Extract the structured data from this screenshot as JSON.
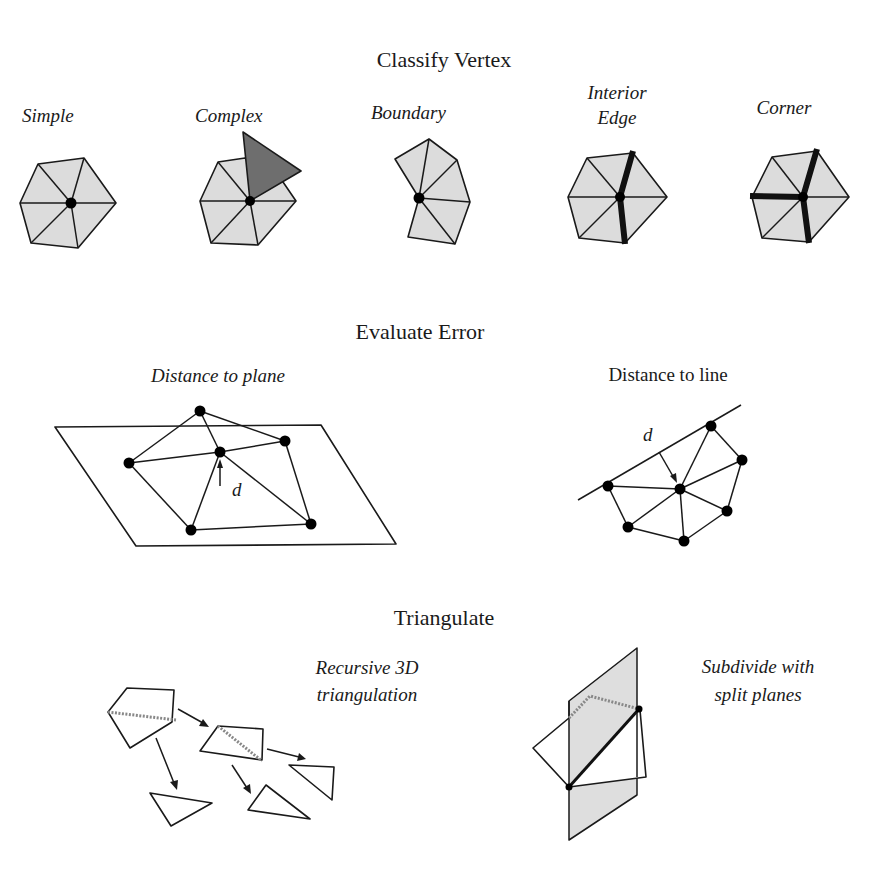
{
  "sections": {
    "classify": {
      "title": "Classify Vertex",
      "cases": [
        {
          "label": "Simple"
        },
        {
          "label": "Complex"
        },
        {
          "label": "Boundary"
        },
        {
          "label_line1": "Interior",
          "label_line2": "Edge"
        },
        {
          "label": "Corner"
        }
      ]
    },
    "evaluate": {
      "title": "Evaluate Error",
      "plane": {
        "label": "Distance to plane",
        "symbol": "d"
      },
      "line": {
        "label": "Distance to line",
        "symbol": "d"
      }
    },
    "triangulate": {
      "title": "Triangulate",
      "recursive": {
        "label_line1": "Recursive 3D",
        "label_line2": "triangulation"
      },
      "split": {
        "label_line1": "Subdivide with",
        "label_line2": "split planes"
      }
    }
  },
  "colors": {
    "fill_light": "#dcdcdc",
    "fill_dark": "#6e6e6e",
    "stroke": "#1a1a1a",
    "background": "#ffffff"
  }
}
